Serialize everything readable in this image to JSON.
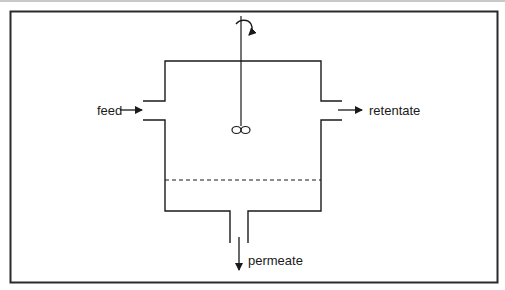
{
  "diagram": {
    "labels": {
      "feed": "feed",
      "retentate": "retentate",
      "permeate": "permeate"
    },
    "components": {
      "vessel": "stirred-vessel",
      "membrane": "membrane (dashed line)",
      "stirrer": "impeller with rotation arrow"
    },
    "colors": {
      "stroke": "#1a1a1a",
      "frame": "#2a2a2a",
      "background": "#ffffff"
    }
  }
}
